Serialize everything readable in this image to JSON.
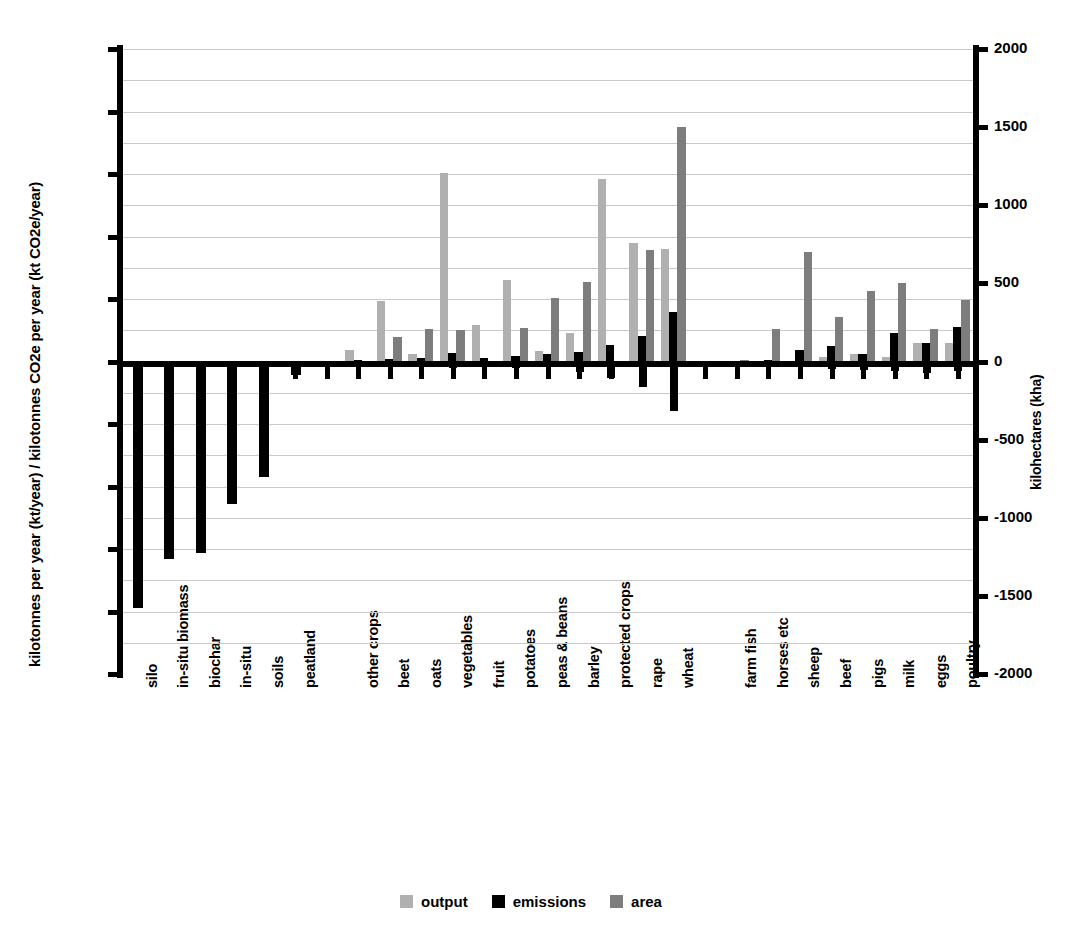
{
  "chart_data": {
    "type": "bar",
    "title": "",
    "subtitle": "",
    "ylabel": "kilotonnes per year (kt/year) / kilotonnes CO2e per year (kt CO2e/year)",
    "ylabel_right": "kilohectares (kha)",
    "xlabel": "",
    "ylim": [
      -25000,
      25000
    ],
    "ylim_right": [
      -2000,
      2000
    ],
    "ytick_labels": [
      "25000",
      "20000",
      "15000",
      "10000",
      "5000",
      "0",
      "-5000",
      "-10000",
      "-15000",
      "-20000",
      "-25000"
    ],
    "ytick_values": [
      25000,
      20000,
      15000,
      10000,
      5000,
      0,
      -5000,
      -10000,
      -15000,
      -20000,
      -25000
    ],
    "ytick_labels_right": [
      "2000",
      "1500",
      "1000",
      "500",
      "0",
      "-500",
      "-1000",
      "-1500",
      "-2000"
    ],
    "ytick_values_right": [
      2000,
      1500,
      1000,
      500,
      0,
      -500,
      -1000,
      -1500,
      -2000
    ],
    "grid": true,
    "grid_step": 2500,
    "legend_position": "bottom-center",
    "series": [
      {
        "name": "output",
        "color": "#b0b0b0",
        "axis": "left"
      },
      {
        "name": "emissions",
        "color": "#000000",
        "axis": "left"
      },
      {
        "name": "area",
        "color": "#7d7d7d",
        "axis": "right"
      }
    ],
    "categories": [
      "silo",
      "in-situ biomass",
      "biochar",
      "in-situ",
      "soils",
      "peatland",
      "",
      "other crops",
      "beet",
      "oats",
      "vegetables",
      "fruit",
      "potatoes",
      "peas & beans",
      "barley",
      "protected crops",
      "rape",
      "wheat",
      "",
      "farm fish",
      "horses etc",
      "sheep",
      "beef",
      "pigs",
      "milk",
      "eggs",
      "poultry"
    ],
    "values": {
      "output": [
        0,
        0,
        0,
        0,
        0,
        0,
        0,
        900,
        4850,
        600,
        15050,
        2900,
        6550,
        850,
        2250,
        14600,
        9450,
        9000,
        0,
        0,
        0,
        0,
        350,
        600,
        350,
        1500,
        1450
      ],
      "emissions": [
        -19700,
        -15800,
        -15300,
        -11400,
        -9200,
        -1050,
        0,
        -300,
        -450,
        -400,
        -500,
        -350,
        -500,
        -400,
        -850,
        -1300,
        -2050,
        -3950,
        0,
        -100,
        -250,
        -450,
        -600,
        -700,
        -750,
        -950,
        -750
      ],
      "area": [
        0,
        0,
        0,
        0,
        0,
        0,
        0,
        0,
        2000,
        2600,
        2500,
        0,
        2700,
        5100,
        6350,
        0,
        8900,
        18800,
        0,
        150,
        2600,
        8800,
        3550,
        5650,
        6300,
        2600,
        4900
      ]
    },
    "values_positive_emissions": {
      "emissions_positive": [
        0,
        0,
        0,
        0,
        0,
        0,
        0,
        100,
        200,
        250,
        700,
        300,
        450,
        600,
        750,
        1300,
        2050,
        3950,
        0,
        50,
        150,
        950,
        1250,
        600,
        2300,
        1500,
        2750
      ]
    }
  },
  "legend": {
    "items": [
      {
        "label": "output",
        "color": "#b0b0b0"
      },
      {
        "label": "emissions",
        "color": "#000000"
      },
      {
        "label": "area",
        "color": "#7d7d7d"
      }
    ]
  }
}
